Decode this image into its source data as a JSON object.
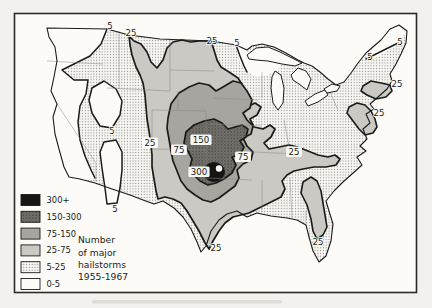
{
  "figure": {
    "caption_lines": [
      "Number",
      "of major",
      "hailstorms",
      "1955-1967"
    ],
    "legend": {
      "items": [
        {
          "label": "300+",
          "fill": "black"
        },
        {
          "label": "150-300",
          "fill": "hatch-dark"
        },
        {
          "label": "75-150",
          "fill": "gray-med"
        },
        {
          "label": "25-75",
          "fill": "gray-light"
        },
        {
          "label": "5-25",
          "fill": "dots"
        },
        {
          "label": "0-5",
          "fill": "white"
        }
      ]
    },
    "map": {
      "contour_labels": [
        {
          "text": "5",
          "x": 110,
          "y": 26,
          "boxed": false
        },
        {
          "text": "25",
          "x": 131,
          "y": 33,
          "boxed": false
        },
        {
          "text": "25",
          "x": 212,
          "y": 41,
          "boxed": false
        },
        {
          "text": "5",
          "x": 237,
          "y": 43,
          "boxed": false
        },
        {
          "text": "5",
          "x": 400,
          "y": 42,
          "boxed": false
        },
        {
          "text": "5",
          "x": 370,
          "y": 57,
          "boxed": false
        },
        {
          "text": "25",
          "x": 397,
          "y": 84,
          "boxed": false
        },
        {
          "text": "25",
          "x": 379,
          "y": 113,
          "boxed": false
        },
        {
          "text": "5",
          "x": 112,
          "y": 131,
          "boxed": false
        },
        {
          "text": "5",
          "x": 115,
          "y": 209,
          "boxed": false
        },
        {
          "text": "25",
          "x": 150,
          "y": 143,
          "boxed": true
        },
        {
          "text": "75",
          "x": 179,
          "y": 150,
          "boxed": true
        },
        {
          "text": "150",
          "x": 201,
          "y": 140,
          "boxed": true
        },
        {
          "text": "75",
          "x": 243,
          "y": 157,
          "boxed": true
        },
        {
          "text": "25",
          "x": 294,
          "y": 152,
          "boxed": true
        },
        {
          "text": "300",
          "x": 199,
          "y": 172,
          "boxed": true
        },
        {
          "text": "25",
          "x": 216,
          "y": 248,
          "boxed": false
        },
        {
          "text": "25",
          "x": 318,
          "y": 242,
          "boxed": false
        }
      ]
    },
    "colors": {
      "frame": "#2b2b28",
      "band_300plus": "#161513",
      "band_150_300": "#73726d",
      "band_150_300_dot": "#4e4d49",
      "band_75_150": "#a6a5a0",
      "band_25_75": "#cac9c4",
      "band_5_25_bg": "#f8f7f4",
      "band_5_25_dot": "#908f8b",
      "band_0_5": "#fcfbf8",
      "contour_line": "#1b1b19",
      "state_line": "#8a8984",
      "label_text": "#1b1b19"
    }
  }
}
